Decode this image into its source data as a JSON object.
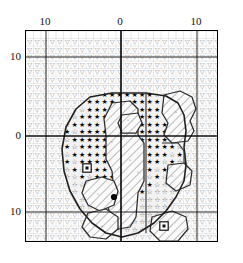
{
  "figure": {
    "kind": "symbol-contour-map",
    "background": "#ffffff",
    "frame_color": "#000000",
    "grid_color": "#c9c9c9",
    "axis_color": "#1a1a1a"
  },
  "axes": {
    "top": {
      "labels": [
        "10",
        "0",
        "10"
      ],
      "positions_px": [
        45,
        120,
        196
      ]
    },
    "left": {
      "labels": [
        "10",
        "0",
        "10"
      ],
      "positions_px": [
        56,
        135,
        211
      ]
    },
    "zero_lines": {
      "vertical_x_px": 120,
      "horizontal_y_px": 135
    },
    "minor_major_lines_x_px": [
      45,
      196
    ],
    "minor_major_lines_y_px": [
      56,
      211
    ]
  },
  "chart_data": {
    "type": "heatmap",
    "title": "",
    "xlabel": "",
    "ylabel": "",
    "xticks": [
      "10",
      "0",
      "10"
    ],
    "yticks": [
      "10",
      "0",
      "10"
    ],
    "grid": true,
    "legend": null,
    "cell_size_px": 7.5,
    "symbol_legend": [
      {
        "key": "open-triangle-down",
        "glyph": "▽",
        "meaning": "background-level region"
      },
      {
        "key": "open-star",
        "glyph": "☆",
        "meaning": "mid-level region"
      },
      {
        "key": "filled-star",
        "glyph": "★",
        "meaning": "high-level region"
      },
      {
        "key": "hatch",
        "glyph": "/",
        "meaning": "diagonal-hatched inner region"
      },
      {
        "key": "small-circle",
        "glyph": "◦",
        "meaning": "minor marker inside hatch"
      },
      {
        "key": "filled-dot",
        "glyph": "●",
        "meaning": "peak point marker"
      },
      {
        "key": "boxed-dot",
        "glyph": "□",
        "meaning": "boxed reference marker"
      }
    ],
    "markers": [
      {
        "name": "peak-dot",
        "x_px": 113,
        "y_px": 196,
        "type": "filled-dot"
      },
      {
        "name": "boxed-marker-left",
        "x_px": 86,
        "y_px": 167,
        "type": "boxed-dot"
      },
      {
        "name": "boxed-marker-bottom-right",
        "x_px": 163,
        "y_px": 225,
        "type": "boxed-dot"
      }
    ]
  }
}
